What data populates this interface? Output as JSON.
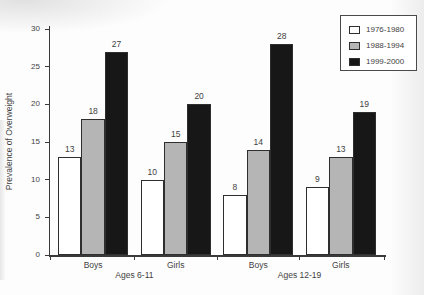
{
  "figure": {
    "background": "#fdfdfd",
    "text_color": "#3f3f3f",
    "axis_color": "#3a3a3a"
  },
  "chart_data": {
    "type": "bar",
    "title": "",
    "xlabel": "",
    "ylabel": "Prevalence of Overweight",
    "ylim": [
      0,
      30
    ],
    "yticks": [
      0,
      5,
      10,
      15,
      20,
      25,
      30
    ],
    "grid": false,
    "show_value_labels": true,
    "categories": [
      "Boys",
      "Girls",
      "Boys",
      "Girls"
    ],
    "category_group_labels": [
      {
        "label": "Ages 6-11",
        "span": [
          0,
          1
        ]
      },
      {
        "label": "Ages 12-19",
        "span": [
          2,
          3
        ]
      }
    ],
    "series": [
      {
        "name": "1976-1980",
        "color": "#ffffff",
        "values": [
          13,
          10,
          8,
          9
        ]
      },
      {
        "name": "1988-1994",
        "color": "#b5b5b5",
        "values": [
          18,
          15,
          14,
          13
        ]
      },
      {
        "name": "1999-2000",
        "color": "#171717",
        "values": [
          27,
          20,
          28,
          19
        ]
      }
    ],
    "legend": {
      "position": "top-right",
      "entries": [
        "1976-1980",
        "1988-1994",
        "1999-2000"
      ]
    }
  }
}
